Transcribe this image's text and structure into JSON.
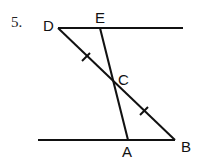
{
  "problem_number": "5.",
  "points": {
    "D": {
      "label": "D",
      "x": 58,
      "y": 28
    },
    "E": {
      "label": "E",
      "x": 100,
      "y": 28
    },
    "C": {
      "label": "C",
      "x": 114,
      "y": 84
    },
    "A": {
      "label": "A",
      "x": 128,
      "y": 140
    },
    "B": {
      "label": "B",
      "x": 175,
      "y": 140
    }
  },
  "lines": {
    "top": {
      "x1": 58,
      "y1": 28,
      "x2": 183,
      "y2": 28
    },
    "bottom": {
      "x1": 38,
      "y1": 140,
      "x2": 175,
      "y2": 140
    },
    "DB": {
      "x1": 58,
      "y1": 28,
      "x2": 175,
      "y2": 140
    },
    "EA": {
      "x1": 100,
      "y1": 28,
      "x2": 128,
      "y2": 140
    }
  },
  "tick_marks": [
    "DC",
    "CB"
  ],
  "colors": {
    "stroke": "#111111",
    "background": "#ffffff"
  }
}
